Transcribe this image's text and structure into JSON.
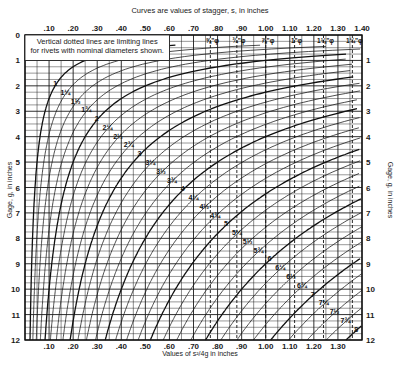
{
  "chart_data": {
    "type": "line",
    "title": "Curves are values of stagger, s, in inches",
    "xlabel": "Values of s²/4g in inches",
    "ylabel": "Gage, g, in inches",
    "xlim": [
      0,
      1.4
    ],
    "ylim": [
      0,
      12
    ],
    "y_inverted": true,
    "grid": true,
    "x_ticks": [
      ".10",
      ".20",
      ".30",
      ".40",
      ".50",
      ".60",
      ".70",
      ".80",
      ".90",
      "1.00",
      "1.10",
      "1.20",
      "1.30",
      "1.40"
    ],
    "x_tick_values": [
      0.1,
      0.2,
      0.3,
      0.4,
      0.5,
      0.6,
      0.7,
      0.8,
      0.9,
      1.0,
      1.1,
      1.2,
      1.3,
      1.4
    ],
    "x_ticks_bottom": [
      ".10",
      ".20",
      ".30",
      ".40",
      ".50",
      ".60",
      ".70",
      ".80",
      ".90",
      "1.00",
      "1.10",
      "1.20",
      "1.30"
    ],
    "y_ticks_left": [
      "0",
      "1",
      "2",
      "3",
      "4",
      "5",
      "6",
      "7",
      "8",
      "9",
      "10",
      "11",
      "12"
    ],
    "y_ticks_right": [
      "1",
      "2",
      "3",
      "4",
      "5",
      "6",
      "7",
      "8",
      "9",
      "10",
      "11",
      "12"
    ],
    "note_line1": "Vertical dotted lines are limiting lines",
    "note_line2": "for rivets with nominal diameters shown.",
    "formula": "x = s² / (4g)",
    "series": [
      {
        "name": "1",
        "stagger": 1.0
      },
      {
        "name": "1¼",
        "stagger": 1.25
      },
      {
        "name": "1½",
        "stagger": 1.5
      },
      {
        "name": "1¾",
        "stagger": 1.75
      },
      {
        "name": "2",
        "stagger": 2.0
      },
      {
        "name": "2¼",
        "stagger": 2.25
      },
      {
        "name": "2½",
        "stagger": 2.5
      },
      {
        "name": "2¾",
        "stagger": 2.75
      },
      {
        "name": "3",
        "stagger": 3.0
      },
      {
        "name": "3¼",
        "stagger": 3.25
      },
      {
        "name": "3½",
        "stagger": 3.5
      },
      {
        "name": "3¾",
        "stagger": 3.75
      },
      {
        "name": "4",
        "stagger": 4.0
      },
      {
        "name": "4¼",
        "stagger": 4.25
      },
      {
        "name": "4½",
        "stagger": 4.5
      },
      {
        "name": "4¾",
        "stagger": 4.75
      },
      {
        "name": "5",
        "stagger": 5.0
      },
      {
        "name": "5¼",
        "stagger": 5.25
      },
      {
        "name": "5½",
        "stagger": 5.5
      },
      {
        "name": "5¾",
        "stagger": 5.75
      },
      {
        "name": "6",
        "stagger": 6.0
      },
      {
        "name": "6¼",
        "stagger": 6.25
      },
      {
        "name": "6½",
        "stagger": 6.5
      },
      {
        "name": "6¾",
        "stagger": 6.75
      },
      {
        "name": "7",
        "stagger": 7.0
      },
      {
        "name": "7¼",
        "stagger": 7.25
      },
      {
        "name": "7½",
        "stagger": 7.5
      },
      {
        "name": "7¾",
        "stagger": 7.75
      },
      {
        "name": "8",
        "stagger": 8.0
      }
    ],
    "rivet_limits": [
      {
        "label": "⅝\"φ",
        "value": 0.77
      },
      {
        "label": "¾\"φ",
        "value": 0.88
      },
      {
        "label": "⅞\"φ",
        "value": 1.0
      },
      {
        "label": "1\"φ",
        "value": 1.12
      },
      {
        "label": "1⅛\"φ",
        "value": 1.24
      },
      {
        "label": "1¼\"φ",
        "value": 1.36
      }
    ]
  }
}
